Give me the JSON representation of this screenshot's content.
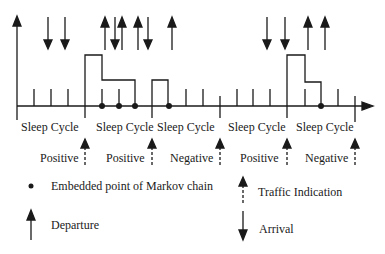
{
  "diagram": {
    "cycles": [
      {
        "label": "Sleep Cycle",
        "indication": "Positive"
      },
      {
        "label": "Sleep Cycle",
        "indication": "Positive"
      },
      {
        "label": "Sleep Cycle",
        "indication": "Negative"
      },
      {
        "label": "Sleep Cycle",
        "indication": "Positive"
      },
      {
        "label": "Sleep Cycle",
        "indication": "Negative"
      }
    ]
  },
  "legend": {
    "embedded_point": "Embedded point of Markov chain",
    "departure": "Departure",
    "traffic_indication": "Traffic Indication",
    "arrival": "Arrival"
  },
  "colors": {
    "line": "#1a1a1a",
    "background": "#ffffff"
  }
}
